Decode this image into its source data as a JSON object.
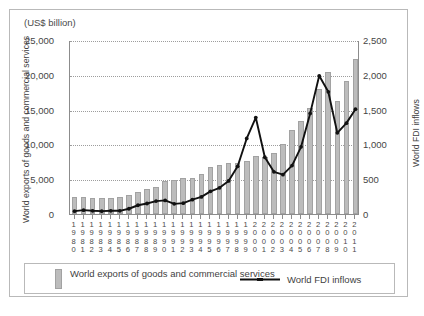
{
  "figure": {
    "unit_label": "(US$ billion)",
    "top_cut_text": "",
    "bottom_cut_text": ""
  },
  "legend": {
    "bars_label_line1": "World exports of goods",
    "bars_label_line2": "and commercial services",
    "line_label": "World FDI inflows"
  },
  "colors": {
    "bar_fill": "#bcbcbc",
    "bar_stroke": "#a2a2a2",
    "line": "#111111",
    "axis": "#8c8c8c",
    "grid": "#9d9d9d",
    "frame": "#b9b9b9"
  },
  "chart_data": {
    "type": "bar",
    "title": "",
    "subtitle": "",
    "xlabel": "",
    "ylabel": "World exports of goods and commercial services",
    "ylabel_secondary": "World FDI inflows",
    "unit": "US$ billion",
    "grid": true,
    "legend_position": "bottom",
    "ylim": [
      0,
      25000
    ],
    "ylim_secondary": [
      0,
      2500
    ],
    "yticks": [
      0,
      5000,
      10000,
      15000,
      20000,
      25000
    ],
    "ytick_labels": [
      "0",
      "5,000",
      "10,000",
      "15,000",
      "20,000",
      "25,000"
    ],
    "yticks_secondary": [
      0,
      500,
      1000,
      1500,
      2000,
      2500
    ],
    "ytick_labels_secondary": [
      "0",
      "500",
      "1,000",
      "1,500",
      "2,000",
      "2,500"
    ],
    "categories": [
      "1980",
      "1981",
      "1982",
      "1983",
      "1984",
      "1985",
      "1986",
      "1987",
      "1988",
      "1989",
      "1990",
      "1991",
      "1992",
      "1993",
      "1994",
      "1995",
      "1996",
      "1997",
      "1998",
      "1999",
      "2000",
      "2001",
      "2002",
      "2003",
      "2004",
      "2005",
      "2006",
      "2007",
      "2008",
      "2009",
      "2010",
      "2011"
    ],
    "series": [
      {
        "name": "World exports of goods and commercial services",
        "type": "bar",
        "axis": "left",
        "values": [
          2400,
          2400,
          2250,
          2250,
          2350,
          2400,
          2700,
          3150,
          3600,
          3950,
          4700,
          4850,
          5200,
          5200,
          5800,
          6800,
          7100,
          7400,
          7300,
          7600,
          8400,
          8200,
          8700,
          10100,
          12000,
          13400,
          15300,
          17900,
          20400,
          16200,
          19100,
          22300
        ]
      },
      {
        "name": "World FDI inflows",
        "type": "line",
        "axis": "right",
        "values": [
          55,
          70,
          60,
          55,
          60,
          60,
          90,
          140,
          165,
          200,
          210,
          160,
          170,
          220,
          260,
          340,
          390,
          490,
          700,
          1100,
          1400,
          830,
          620,
          580,
          710,
          980,
          1460,
          2000,
          1770,
          1180,
          1320,
          1520
        ]
      }
    ]
  }
}
